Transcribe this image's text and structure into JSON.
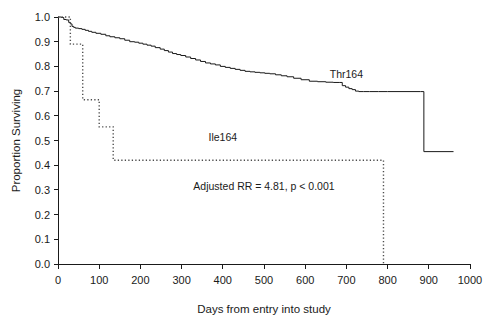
{
  "chart_data": {
    "type": "line",
    "title": "",
    "subtitle": "",
    "xlabel": "Days from entry into study",
    "ylabel": "Proportion Surviving",
    "xlim": [
      0,
      1000
    ],
    "ylim": [
      0.0,
      1.0
    ],
    "grid": false,
    "legend_position": "inline-curve-labels",
    "x_ticks": [
      0,
      100,
      200,
      300,
      400,
      500,
      600,
      700,
      800,
      900,
      1000
    ],
    "x_tick_labels": [
      "0",
      "100",
      "200",
      "300",
      "400",
      "500",
      "600",
      "700",
      "800",
      "900",
      "1000"
    ],
    "y_ticks": [
      0.0,
      0.1,
      0.2,
      0.3,
      0.4,
      0.5,
      0.6,
      0.7,
      0.8,
      0.9,
      1.0
    ],
    "y_tick_labels": [
      "0.0",
      "0.1",
      "0.2",
      "0.3",
      "0.4",
      "0.5",
      "0.6",
      "0.7",
      "0.8",
      "0.9",
      "1.0"
    ],
    "annotations": [
      {
        "name": "adjusted-rr-annotation",
        "text": "Adjusted RR = 4.81, p < 0.001",
        "x": 500,
        "y": 0.3
      }
    ],
    "series": [
      {
        "name": "Thr164",
        "style": "solid",
        "color": "#1a1a1a",
        "label_x": 700,
        "label_y": 0.755,
        "step": true,
        "x": [
          0,
          8,
          14,
          20,
          26,
          30,
          34,
          38,
          42,
          50,
          58,
          66,
          74,
          82,
          92,
          104,
          116,
          126,
          138,
          150,
          162,
          174,
          186,
          196,
          206,
          216,
          226,
          236,
          248,
          258,
          268,
          278,
          288,
          298,
          310,
          322,
          334,
          346,
          358,
          370,
          382,
          394,
          406,
          418,
          430,
          442,
          454,
          466,
          478,
          490,
          502,
          514,
          528,
          542,
          556,
          572,
          590,
          610,
          630,
          650,
          668,
          684,
          690,
          698,
          706,
          714,
          722,
          730,
          742,
          756,
          778,
          800,
          880,
          888,
          960
        ],
        "y": [
          1.0,
          0.998,
          0.99,
          0.988,
          0.978,
          0.972,
          0.962,
          0.958,
          0.955,
          0.953,
          0.95,
          0.946,
          0.942,
          0.938,
          0.934,
          0.93,
          0.924,
          0.92,
          0.916,
          0.912,
          0.906,
          0.9,
          0.898,
          0.894,
          0.89,
          0.886,
          0.882,
          0.876,
          0.87,
          0.864,
          0.858,
          0.852,
          0.848,
          0.844,
          0.838,
          0.832,
          0.826,
          0.82,
          0.814,
          0.81,
          0.806,
          0.8,
          0.796,
          0.792,
          0.788,
          0.784,
          0.78,
          0.778,
          0.776,
          0.774,
          0.772,
          0.77,
          0.766,
          0.762,
          0.758,
          0.752,
          0.746,
          0.74,
          0.738,
          0.736,
          0.735,
          0.735,
          0.722,
          0.716,
          0.71,
          0.706,
          0.7,
          0.698,
          0.698,
          0.698,
          0.698,
          0.698,
          0.698,
          0.455,
          0.455
        ]
      },
      {
        "name": "Ile164",
        "style": "dotted",
        "color": "#4d4d4d",
        "label_x": 400,
        "label_y": 0.5,
        "step": true,
        "x": [
          0,
          24,
          30,
          58,
          60,
          96,
          100,
          128,
          134,
          786,
          790
        ],
        "y": [
          1.0,
          1.0,
          0.89,
          0.89,
          0.665,
          0.665,
          0.555,
          0.555,
          0.42,
          0.42,
          0.0
        ]
      }
    ]
  },
  "figure": {
    "background_color": "#ffffff",
    "axis_color": "#1a1a1a"
  }
}
